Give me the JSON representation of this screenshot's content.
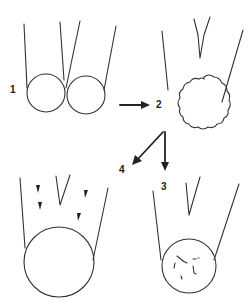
{
  "diagram": {
    "stages": [
      {
        "id": "1",
        "label": "1",
        "description": "two adjacent spheres at tubule openings"
      },
      {
        "id": "2",
        "label": "2",
        "description": "single sphere with wavy outline"
      },
      {
        "id": "3",
        "label": "3",
        "description": "sphere with internal fragments"
      },
      {
        "id": "4",
        "label": "4",
        "description": "large sphere with small arrowheads above"
      }
    ],
    "arrows": [
      {
        "from": "1",
        "to": "2"
      },
      {
        "from": "2",
        "to": "4"
      },
      {
        "from": "2",
        "to": "3"
      }
    ],
    "colors": {
      "line": "#333333",
      "background": "#ffffff"
    }
  }
}
